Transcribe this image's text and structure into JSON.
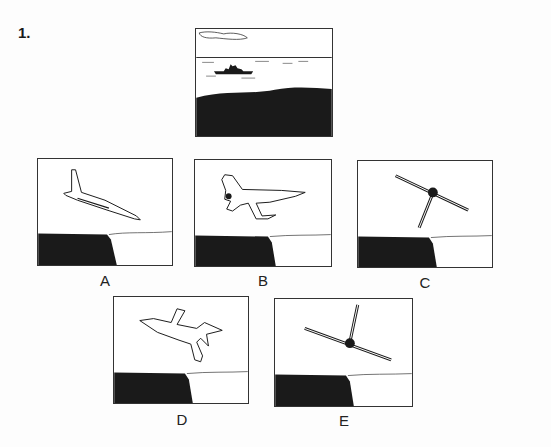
{
  "question": {
    "number": "1.",
    "reference_view": "ship-at-sea-from-over-coast",
    "options": [
      {
        "label": "A",
        "view": "aircraft-side-climbing-nose-down-right"
      },
      {
        "label": "B",
        "view": "aircraft-top-level-nose-right"
      },
      {
        "label": "C",
        "view": "aircraft-head-on-banked-tail-down"
      },
      {
        "label": "D",
        "view": "aircraft-top-banked-nose-left"
      },
      {
        "label": "E",
        "view": "aircraft-rear-banked-tail-up"
      }
    ]
  },
  "colors": {
    "ink": "#1a1a1a",
    "background": "#ffffff"
  }
}
